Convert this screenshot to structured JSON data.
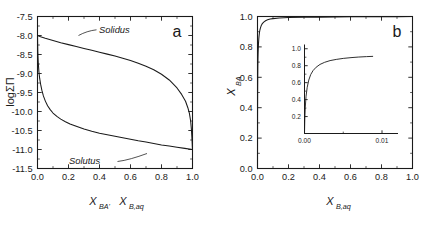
{
  "figure": {
    "panel_a_letter": "a",
    "panel_b_letter": "b"
  },
  "chart_data": [
    {
      "type": "line",
      "panel": "a",
      "title": "",
      "xlabel": "X_BA'  X_B,aq",
      "xlabel_parts": [
        {
          "base": "X",
          "sub": "BA'"
        },
        {
          "base": "X",
          "sub": "B,aq"
        }
      ],
      "ylabel": "logΣΠ",
      "xlim": [
        0.0,
        1.0
      ],
      "ylim": [
        -11.5,
        -7.5
      ],
      "xticks": [
        "0.0",
        "0.2",
        "0.4",
        "0.6",
        "0.8",
        "1.0"
      ],
      "xtick_values": [
        0.0,
        0.2,
        0.4,
        0.6,
        0.8,
        1.0
      ],
      "yticks": [
        "-7.5",
        "-8.0",
        "-8.5",
        "-9.0",
        "-9.5",
        "-10.0",
        "-10.5",
        "-11.0",
        "-11.5"
      ],
      "ytick_values": [
        -7.5,
        -8.0,
        -8.5,
        -9.0,
        -9.5,
        -10.0,
        -10.5,
        -11.0,
        -11.5
      ],
      "grid": false,
      "legend": "none",
      "minor_ticks": true,
      "annotations": [
        {
          "text": "Solidus",
          "style": "italic",
          "x": 0.4,
          "y": -8.1
        },
        {
          "text": "Solutus",
          "style": "italic",
          "x": 0.33,
          "y": -10.95
        }
      ],
      "series": [
        {
          "name": "Solidus",
          "x": [
            0.0,
            0.02,
            0.05,
            0.1,
            0.15,
            0.2,
            0.25,
            0.3,
            0.35,
            0.4,
            0.45,
            0.5,
            0.55,
            0.6,
            0.65,
            0.7,
            0.75,
            0.8,
            0.85,
            0.9,
            0.93,
            0.955,
            0.97,
            0.98,
            0.988,
            0.993,
            0.996,
            0.998,
            0.999,
            1.0
          ],
          "y": [
            -8.0,
            -8.03,
            -8.07,
            -8.13,
            -8.19,
            -8.24,
            -8.29,
            -8.34,
            -8.39,
            -8.44,
            -8.49,
            -8.54,
            -8.6,
            -8.66,
            -8.73,
            -8.81,
            -8.9,
            -9.02,
            -9.17,
            -9.38,
            -9.55,
            -9.73,
            -9.9,
            -10.05,
            -10.25,
            -10.47,
            -10.67,
            -10.83,
            -10.93,
            -11.0
          ]
        },
        {
          "name": "Solutus",
          "x": [
            0.0,
            0.002,
            0.005,
            0.009,
            0.014,
            0.02,
            0.028,
            0.038,
            0.05,
            0.065,
            0.082,
            0.1,
            0.125,
            0.15,
            0.18,
            0.21,
            0.25,
            0.3,
            0.35,
            0.4,
            0.45,
            0.5,
            0.55,
            0.6,
            0.65,
            0.7,
            0.75,
            0.8,
            0.85,
            0.9,
            0.95,
            1.0
          ],
          "y": [
            -8.0,
            -8.42,
            -8.72,
            -8.95,
            -9.13,
            -9.28,
            -9.44,
            -9.59,
            -9.72,
            -9.85,
            -9.95,
            -10.04,
            -10.13,
            -10.2,
            -10.27,
            -10.33,
            -10.39,
            -10.46,
            -10.52,
            -10.57,
            -10.61,
            -10.65,
            -10.69,
            -10.73,
            -10.77,
            -10.8,
            -10.84,
            -10.88,
            -10.91,
            -10.94,
            -10.97,
            -11.0
          ]
        }
      ]
    },
    {
      "type": "line",
      "panel": "b",
      "title": "",
      "xlabel": "X_B,aq",
      "xlabel_parts": [
        {
          "base": "X",
          "sub": "B,aq"
        }
      ],
      "ylabel": "X_BA",
      "ylabel_parts": [
        {
          "base": "X",
          "sub": "BA"
        }
      ],
      "xlim": [
        0.0,
        1.0
      ],
      "ylim": [
        0.0,
        1.0
      ],
      "xticks": [
        "0.0",
        "0.2",
        "0.4",
        "0.6",
        "0.8",
        "1.0"
      ],
      "xtick_values": [
        0.0,
        0.2,
        0.4,
        0.6,
        0.8,
        1.0
      ],
      "yticks": [
        "0.0",
        "0.2",
        "0.4",
        "0.6",
        "0.8",
        "1.0"
      ],
      "ytick_values": [
        0.0,
        0.2,
        0.4,
        0.6,
        0.8,
        1.0
      ],
      "grid": false,
      "legend": "none",
      "minor_ticks": true,
      "series": [
        {
          "name": "XBA vs XB,aq",
          "x": [
            0.0,
            0.0004,
            0.0009,
            0.0015,
            0.0022,
            0.003,
            0.004,
            0.0052,
            0.0066,
            0.0082,
            0.01,
            0.0125,
            0.0155,
            0.019,
            0.023,
            0.028,
            0.034,
            0.042,
            0.052,
            0.065,
            0.082,
            0.1,
            0.14,
            0.2,
            0.3,
            0.4,
            0.5,
            0.6,
            0.7,
            0.8,
            0.9,
            1.0
          ],
          "y": [
            0.0,
            0.33,
            0.5,
            0.6,
            0.67,
            0.72,
            0.76,
            0.795,
            0.825,
            0.85,
            0.872,
            0.893,
            0.911,
            0.925,
            0.937,
            0.948,
            0.957,
            0.965,
            0.972,
            0.978,
            0.983,
            0.986,
            0.99,
            0.993,
            0.995,
            0.996,
            0.997,
            0.998,
            0.998,
            0.999,
            0.999,
            1.0
          ]
        }
      ],
      "inset": {
        "type": "line",
        "xlim": [
          0.0,
          0.012
        ],
        "ylim": [
          0.0,
          1.05
        ],
        "xticks": [
          "0.00",
          "0.01"
        ],
        "xtick_values": [
          0.0,
          0.01
        ],
        "yticks": [
          "0.2",
          "0.4",
          "0.6",
          "0.8",
          "1.0"
        ],
        "ytick_values": [
          0.2,
          0.4,
          0.6,
          0.8,
          1.0
        ],
        "grid": false,
        "series": [
          {
            "name": "XBA vs XB,aq (zoom)",
            "x": [
              0.0,
              4e-05,
              0.0001,
              0.0002,
              0.00035,
              0.00055,
              0.0008,
              0.0011,
              0.0015,
              0.002,
              0.0026,
              0.0033,
              0.0041,
              0.005,
              0.006,
              0.007,
              0.008,
              0.0088
            ],
            "y": [
              0.0,
              0.17,
              0.31,
              0.44,
              0.545,
              0.63,
              0.695,
              0.742,
              0.782,
              0.815,
              0.84,
              0.86,
              0.874,
              0.886,
              0.895,
              0.902,
              0.907,
              0.91
            ]
          }
        ]
      }
    }
  ]
}
